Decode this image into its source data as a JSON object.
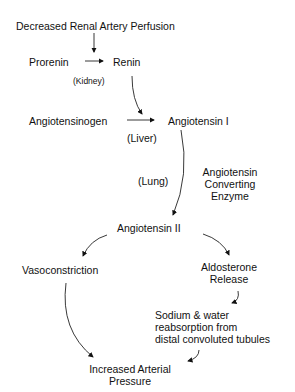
{
  "diagram": {
    "nodes": {
      "trigger": "Decreased Renal Artery Perfusion",
      "prorenin": "Prorenin",
      "renin": "Renin",
      "kidney": "(Kidney)",
      "angiotensinogen": "Angiotensinogen",
      "angiotensin1": "Angiotensin I",
      "liver": "(Liver)",
      "lung": "(Lung)",
      "ace_line1": "Angiotensin",
      "ace_line2": "Converting",
      "ace_line3": "Enzyme",
      "angiotensin2": "Angiotensin II",
      "vasoconstriction": "Vasoconstriction",
      "aldo_line1": "Aldosterone",
      "aldo_line2": "Release",
      "sodium_line1": "Sodium & water",
      "sodium_line2": "reabsorption from",
      "sodium_line3": "distal convoluted tubules",
      "outcome_line1": "Increased Arterial",
      "outcome_line2": "Pressure"
    },
    "edges": [
      {
        "from": "trigger",
        "to": "prorenin-renin"
      },
      {
        "from": "prorenin",
        "to": "renin"
      },
      {
        "from": "renin",
        "to": "angiotensinogen-angiotensin1"
      },
      {
        "from": "angiotensinogen",
        "to": "angiotensin1"
      },
      {
        "from": "angiotensin1",
        "to": "angiotensin2"
      },
      {
        "from": "angiotensin2",
        "to": "vasoconstriction"
      },
      {
        "from": "angiotensin2",
        "to": "aldosterone"
      },
      {
        "from": "aldosterone",
        "to": "sodium"
      },
      {
        "from": "vasoconstriction",
        "to": "outcome"
      },
      {
        "from": "sodium",
        "to": "outcome"
      }
    ]
  }
}
